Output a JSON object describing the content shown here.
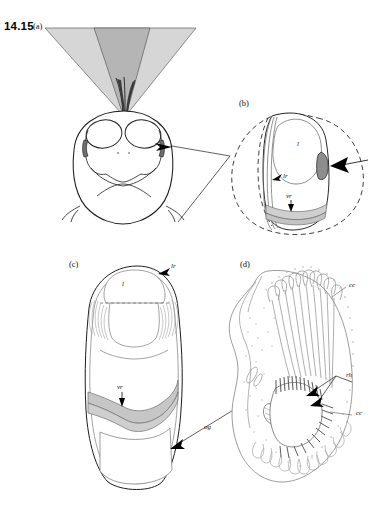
{
  "figure": {
    "number": "14.15",
    "panels": [
      {
        "id": "a",
        "label": "(a)",
        "caption_label": "(a)"
      },
      {
        "id": "b",
        "label": "(b)",
        "caption_label": "(b)"
      },
      {
        "id": "c",
        "label": "(c)",
        "caption_label": "(c)"
      },
      {
        "id": "d",
        "label": "(d)",
        "caption_label": "(d)"
      }
    ]
  },
  "annotations": {
    "panel_b": {
      "lens": "l",
      "lateral_rim": "lr",
      "ventral_rim": "vr"
    },
    "panel_c": {
      "lens": "l",
      "lateral_rim": "lr",
      "ventral_rim": "vr",
      "ommatidial_group": "og"
    },
    "panel_d": {
      "crystalline_cone_upper": "cc",
      "rhabdom": "rh",
      "crystalline_cone_lower": "cc"
    }
  },
  "colors": {
    "outline": "#2b2b2b",
    "light_outline": "#8a8a8a",
    "cone_outer": "#d9d9d9",
    "cone_inner": "#b9b9b9",
    "rim_band": "#c9c9c9",
    "highlight_patch": "#8f8f8f",
    "background": "#ffffff",
    "arrow_fill": "#000000"
  }
}
